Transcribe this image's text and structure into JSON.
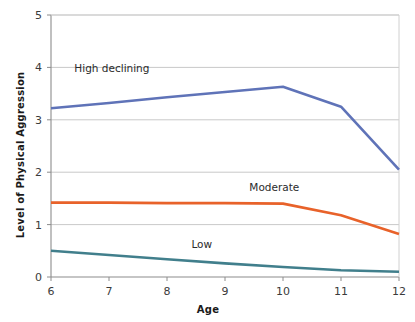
{
  "chart_data": {
    "type": "line",
    "title": "",
    "subtitle": "",
    "xlabel": "Age",
    "ylabel": "Level of Physical Aggression",
    "x": [
      6,
      7,
      8,
      9,
      10,
      11,
      12
    ],
    "xlim": [
      6,
      12
    ],
    "ylim": [
      0,
      5
    ],
    "xticks": [
      "6",
      "7",
      "8",
      "9",
      "10",
      "11",
      "12"
    ],
    "yticks": [
      "0",
      "1",
      "2",
      "3",
      "4",
      "5"
    ],
    "grid": "horizontal",
    "legend_position": "inline-annotations",
    "series": [
      {
        "name": "High declining",
        "color": "#5f73b8",
        "values": [
          3.22,
          3.32,
          3.43,
          3.53,
          3.63,
          3.25,
          2.05
        ]
      },
      {
        "name": "Moderate",
        "color": "#e8622a",
        "values": [
          1.42,
          1.42,
          1.41,
          1.41,
          1.4,
          1.18,
          0.82
        ]
      },
      {
        "name": "Low",
        "color": "#417f8c",
        "values": [
          0.5,
          0.42,
          0.34,
          0.26,
          0.19,
          0.13,
          0.1
        ]
      }
    ],
    "annotations": [
      {
        "text": "High declining",
        "x": 7.05,
        "y": 3.92
      },
      {
        "text": "Moderate",
        "x": 9.85,
        "y": 1.65
      },
      {
        "text": "Low",
        "x": 8.6,
        "y": 0.55
      }
    ]
  },
  "axes": {
    "x_title": "Age",
    "y_title": "Level of Physical Aggression"
  }
}
